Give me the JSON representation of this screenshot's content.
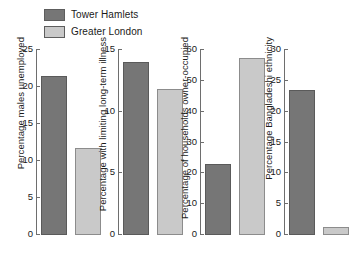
{
  "legend": {
    "items": [
      {
        "label": "Tower Hamlets",
        "color": "#767676",
        "series": "tower_hamlets"
      },
      {
        "label": "Greater London",
        "color": "#c9c9c9",
        "series": "greater_london"
      }
    ]
  },
  "chart_data": {
    "type": "bar",
    "title": "",
    "xlabel": "",
    "grid": false,
    "legend_position": "top-left",
    "categories": [
      "Tower Hamlets",
      "Greater London"
    ],
    "panels": [
      {
        "id": "males-unemployed",
        "ylabel": "Percentage males unemployed",
        "ylim": [
          0,
          25
        ],
        "yticks": [
          0,
          5,
          10,
          15,
          20,
          25
        ],
        "values": [
          21.5,
          11.8
        ],
        "series": [
          {
            "name": "Tower Hamlets",
            "value": 21.5
          },
          {
            "name": "Greater London",
            "value": 11.8
          }
        ]
      },
      {
        "id": "limiting-long-term-illness",
        "ylabel": "Percentage with limiting long-term illness",
        "ylim": [
          0,
          15
        ],
        "yticks": [
          0,
          5,
          10,
          15
        ],
        "values": [
          14.0,
          11.8
        ],
        "series": [
          {
            "name": "Tower Hamlets",
            "value": 14.0
          },
          {
            "name": "Greater London",
            "value": 11.8
          }
        ]
      },
      {
        "id": "households-owner-occupied",
        "ylabel": "Percentage of households owner-occupied",
        "ylim": [
          0,
          60
        ],
        "yticks": [
          0,
          10,
          20,
          30,
          40,
          50,
          60
        ],
        "values": [
          23.0,
          57.5
        ],
        "series": [
          {
            "name": "Tower Hamlets",
            "value": 23.0
          },
          {
            "name": "Greater London",
            "value": 57.5
          }
        ]
      },
      {
        "id": "bangladeshi-ethnicity",
        "ylabel": "Percentage Bangladeshi ethnicity",
        "ylim": [
          0,
          30
        ],
        "yticks": [
          0,
          5,
          10,
          15,
          20,
          25,
          30
        ],
        "values": [
          23.5,
          1.3
        ],
        "series": [
          {
            "name": "Tower Hamlets",
            "value": 23.5
          },
          {
            "name": "Greater London",
            "value": 1.3
          }
        ]
      }
    ]
  },
  "layout": {
    "panel_geometry": [
      {
        "left": 14,
        "plot_left": 22,
        "plot_width": 62,
        "bar_width": 26,
        "bar_gap": 8,
        "first_bar_offset": 4
      },
      {
        "left": 96,
        "plot_left": 22,
        "plot_width": 62,
        "bar_width": 26,
        "bar_gap": 8,
        "first_bar_offset": 4
      },
      {
        "left": 178,
        "plot_left": 22,
        "plot_width": 62,
        "bar_width": 26,
        "bar_gap": 8,
        "first_bar_offset": 4
      },
      {
        "left": 262,
        "plot_left": 22,
        "plot_width": 62,
        "bar_width": 26,
        "bar_gap": 8,
        "first_bar_offset": 4
      }
    ],
    "plot_height": 185,
    "colors": {
      "dark_fill": "#767676",
      "dark_edge": "#5a5a5a",
      "light_fill": "#c9c9c9",
      "light_edge": "#8c8c8c",
      "axis": "#6e6e6e",
      "text": "#1a1a1a",
      "background": "#ffffff"
    }
  }
}
